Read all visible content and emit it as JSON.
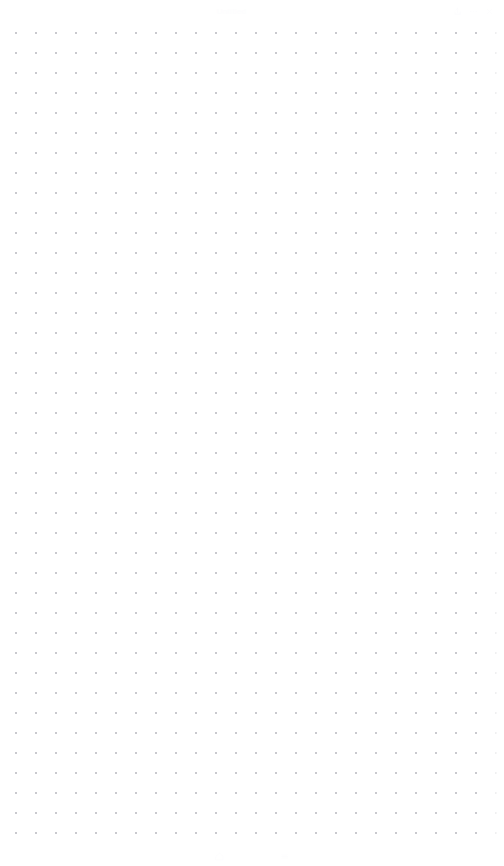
{
  "window": {
    "title": "Untitled",
    "background_color": "#ffffff"
  },
  "top_chrome": {
    "title": "Untitled",
    "icons": [
      {
        "name": "share-icon",
        "glyph": "share"
      },
      {
        "name": "more-icon",
        "glyph": "dots"
      },
      {
        "name": "close-icon",
        "glyph": "close"
      }
    ]
  },
  "canvas": {
    "name": "dot-grid-canvas",
    "background_color": "#ffffff",
    "dot_color": "#c9c9ce",
    "dot_spacing_px": 20,
    "dot_radius_px": 1,
    "grid_origin_x_px": 15,
    "grid_origin_y_px": 32,
    "columns": 24,
    "rows": 41,
    "content": "",
    "empty_state_text": ""
  },
  "bottom_chrome": {
    "items": [
      {
        "name": "bottom-chrome-item",
        "label": ""
      },
      {
        "name": "bottom-chrome-item",
        "label": ""
      },
      {
        "name": "bottom-chrome-item",
        "label": ""
      }
    ]
  }
}
